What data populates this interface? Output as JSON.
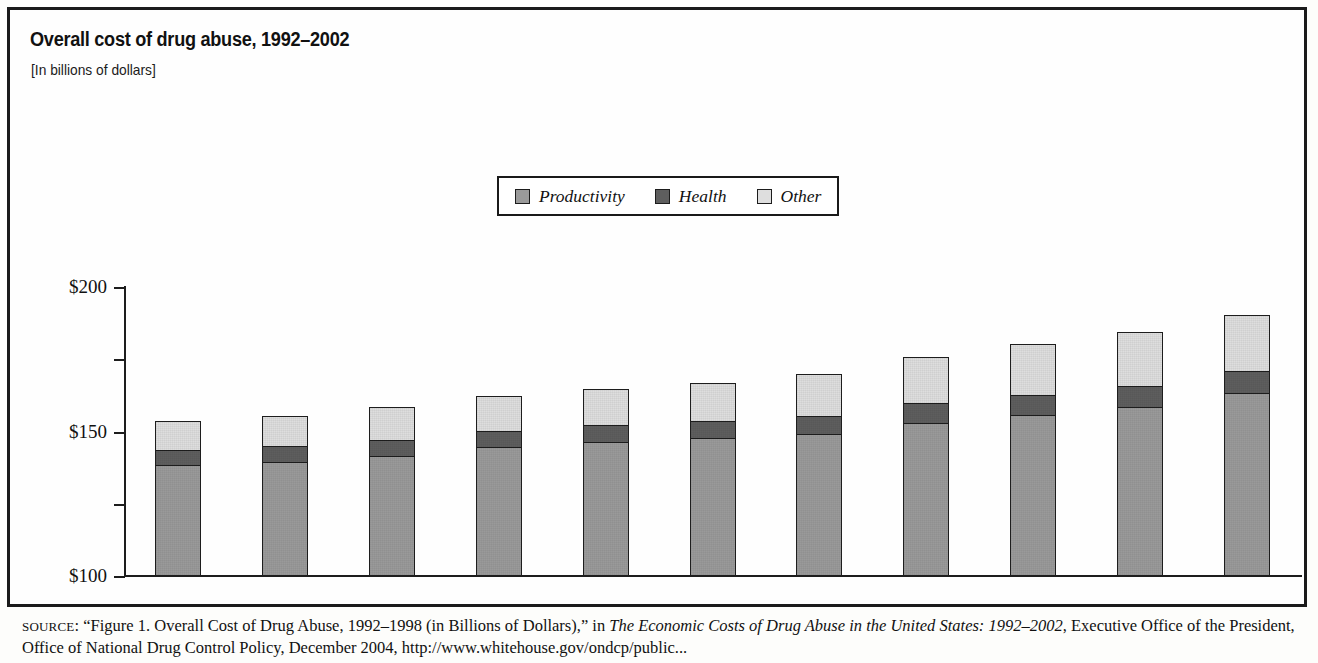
{
  "figure": {
    "title": "Overall cost of drug abuse, 1992–2002",
    "subtitle": "[In billions of dollars]"
  },
  "legend": {
    "items": [
      {
        "label": "Productivity",
        "color": "#9a9a9a",
        "icon": "legend-swatch-icon"
      },
      {
        "label": "Health",
        "color": "#5e5e5e",
        "icon": "legend-swatch-icon"
      },
      {
        "label": "Other",
        "color": "#dedede",
        "icon": "legend-swatch-icon"
      }
    ]
  },
  "source": {
    "prefix": "SOURCE",
    "line1_a": ": “Figure 1. Overall Cost of Drug Abuse, 1992–1998 (in Billions of Dollars),” in ",
    "line1_italic": "The Economic Costs of Drug Abuse in the United States:",
    "line2_italic": "1992–2002",
    "line2_b": ", Executive Office of the President, Office of National Drug Control Policy, December 2004, http://www.whitehouse.gov/ondcp/public..."
  },
  "chart_data": {
    "type": "bar",
    "title": "Overall cost of drug abuse, 1992–2002",
    "subtitle": "[In billions of dollars]",
    "xlabel": "",
    "ylabel": "",
    "ylim": [
      0,
      200
    ],
    "yticks": [
      "$0",
      "$50",
      "$100",
      "$150",
      "$200"
    ],
    "ytick_values": [
      0,
      50,
      100,
      150,
      200
    ],
    "grid": false,
    "stacked": true,
    "legend_position": "top-center",
    "categories": [
      "1992",
      "1993",
      "1994",
      "1995",
      "1996",
      "1997",
      "1998",
      "1999",
      "2000",
      "2001",
      "2002"
    ],
    "totals": [
      107.5,
      110.9,
      117.3,
      124.9,
      129.6,
      133.9,
      140.1,
      151.4,
      160.7,
      169.2,
      180.8
    ],
    "total_labels": [
      "$107.5",
      "$110.9",
      "$117.3",
      "$124.9",
      "$129.6",
      "$133.9",
      "$140.1",
      "$151.4",
      "$160.7",
      "$169.2",
      "$180.8"
    ],
    "series": [
      {
        "name": "Productivity",
        "color": "#9a9a9a",
        "values": [
          77.0,
          79.0,
          83.0,
          89.0,
          93.0,
          95.5,
          98.0,
          106.0,
          111.5,
          117.0,
          126.5
        ]
      },
      {
        "name": "Health",
        "color": "#5e5e5e",
        "values": [
          11.0,
          11.5,
          12.0,
          12.0,
          12.0,
          12.5,
          13.5,
          14.5,
          14.5,
          15.5,
          16.0
        ]
      },
      {
        "name": "Other",
        "color": "#dedede",
        "values": [
          19.5,
          20.4,
          22.3,
          23.9,
          24.6,
          25.9,
          28.6,
          30.9,
          34.7,
          36.7,
          38.3
        ]
      }
    ]
  }
}
